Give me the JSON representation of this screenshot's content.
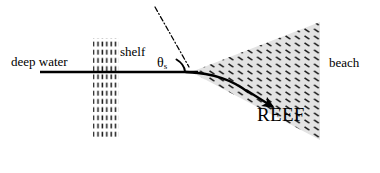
{
  "figure": {
    "background_color": "#ffffff",
    "line_color": "#000000",
    "reef_fill_color": "#e3e3e3",
    "hatch_color": "#1a1a1a",
    "width": 380,
    "height": 173
  },
  "labels": {
    "deep_water": "deep water",
    "shelf": "shelf",
    "beach": "beach",
    "reef": "REEF",
    "theta": "θ",
    "theta_subscript": "s"
  },
  "geometry": {
    "shoreline": {
      "x1": 40,
      "y1": 72,
      "x2": 198,
      "y2": 72
    },
    "normal_dashdot": {
      "x1": 155,
      "y1": 7,
      "x2": 189,
      "y2": 67
    },
    "angle_arc": {
      "cx": 189,
      "cy": 71,
      "r": 17
    },
    "reef_apex": {
      "x": 191,
      "y": 72
    },
    "reef_upper_right": {
      "x": 320,
      "y": 22
    },
    "reef_lower_right": {
      "x": 320,
      "y": 140
    },
    "shelf_column": {
      "x": 93,
      "y_top": 38,
      "width": 26,
      "height": 100
    },
    "ray_arrow_tip": {
      "x": 276,
      "y": 109
    }
  }
}
